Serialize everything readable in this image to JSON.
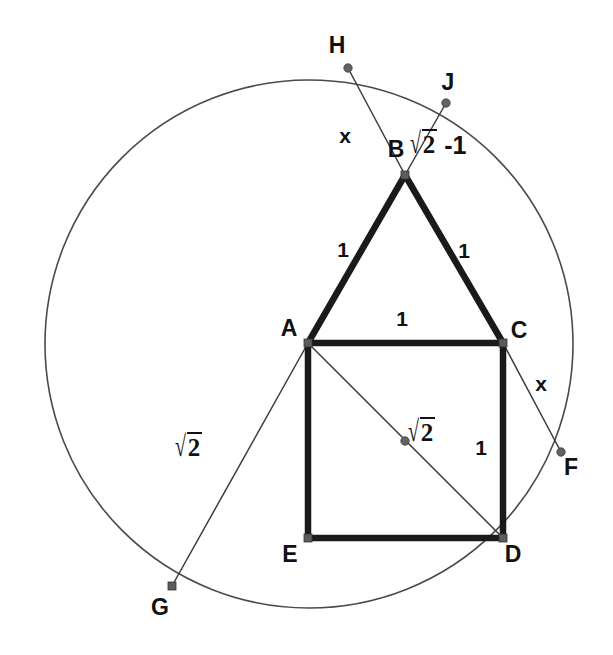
{
  "figure": {
    "type": "geometry-diagram",
    "canvas": {
      "width": 613,
      "height": 655,
      "background": "#ffffff"
    },
    "colors": {
      "circle_stroke": "#4a4a4a",
      "thick_edge": "#1a1a1a",
      "thin_edge": "#3c3c3c",
      "vertex_marker": "#5c5c5c",
      "text": "#111111"
    },
    "circle": {
      "cx": 309,
      "cy": 344,
      "r": 264,
      "label": "circumscribed-circle"
    },
    "points": [
      {
        "id": "A",
        "label": "A",
        "x": 308,
        "y": 343,
        "label_x": 289,
        "label_y": 336,
        "marker": "square"
      },
      {
        "id": "B",
        "label": "B",
        "x": 405,
        "y": 175,
        "label_x": 396,
        "label_y": 157,
        "marker": "square"
      },
      {
        "id": "C",
        "label": "C",
        "x": 503,
        "y": 343,
        "label_x": 519,
        "label_y": 338,
        "marker": "square"
      },
      {
        "id": "D",
        "label": "D",
        "x": 503,
        "y": 538,
        "label_x": 513,
        "label_y": 562,
        "marker": "square"
      },
      {
        "id": "E",
        "label": "E",
        "x": 308,
        "y": 538,
        "label_x": 290,
        "label_y": 562,
        "marker": "square"
      },
      {
        "id": "F",
        "label": "F",
        "x": 561,
        "y": 452,
        "label_x": 571,
        "label_y": 475,
        "marker": "dot"
      },
      {
        "id": "G",
        "label": "G",
        "x": 172,
        "y": 586,
        "label_x": 160,
        "label_y": 615,
        "marker": "square"
      },
      {
        "id": "H",
        "label": "H",
        "x": 348,
        "y": 68,
        "label_x": 337,
        "label_y": 53,
        "marker": "dot"
      },
      {
        "id": "J",
        "label": "J",
        "x": 446,
        "y": 103,
        "label_x": 448,
        "label_y": 90,
        "marker": "dot"
      },
      {
        "id": "M",
        "label": "",
        "x": 405,
        "y": 441,
        "label_x": 0,
        "label_y": 0,
        "marker": "dot"
      }
    ],
    "thick_edges": [
      {
        "name": "edge-A-B",
        "from": "A",
        "to": "B"
      },
      {
        "name": "edge-B-C",
        "from": "B",
        "to": "C"
      },
      {
        "name": "edge-A-C",
        "from": "A",
        "to": "C"
      },
      {
        "name": "edge-C-D",
        "from": "C",
        "to": "D"
      },
      {
        "name": "edge-D-E",
        "from": "D",
        "to": "E"
      },
      {
        "name": "edge-E-A",
        "from": "E",
        "to": "A"
      }
    ],
    "thin_edges": [
      {
        "name": "chord-H-B",
        "from": "H",
        "to": "B"
      },
      {
        "name": "chord-B-J",
        "from": "B",
        "to": "J"
      },
      {
        "name": "chord-C-F",
        "from": "C",
        "to": "F"
      },
      {
        "name": "chord-A-D",
        "from": "A",
        "to": "D"
      },
      {
        "name": "chord-A-G",
        "from": "A",
        "to": "G"
      }
    ],
    "length_labels": [
      {
        "name": "label-x-HB",
        "text": "x",
        "x": 345,
        "y": 143,
        "kind": "plain"
      },
      {
        "name": "label-sqrt2-minus-1-BJ",
        "text": "√2 -1",
        "x": 432,
        "y": 152,
        "kind": "radical",
        "radicand": "2",
        "suffix": "-1"
      },
      {
        "name": "label-1-AB",
        "text": "1",
        "x": 343,
        "y": 257,
        "kind": "plain"
      },
      {
        "name": "label-1-BC",
        "text": "1",
        "x": 464,
        "y": 258,
        "kind": "plain"
      },
      {
        "name": "label-1-AC",
        "text": "1",
        "x": 402,
        "y": 326,
        "kind": "plain"
      },
      {
        "name": "label-x-CF",
        "text": "x",
        "x": 541,
        "y": 391,
        "kind": "plain"
      },
      {
        "name": "label-1-CD",
        "text": "1",
        "x": 481,
        "y": 455,
        "kind": "plain"
      },
      {
        "name": "label-sqrt2-AD",
        "text": "√2",
        "x": 430,
        "y": 440,
        "kind": "radical",
        "radicand": "2",
        "suffix": ""
      },
      {
        "name": "label-sqrt2-AG",
        "text": "√2",
        "x": 197,
        "y": 455,
        "kind": "radical",
        "radicand": "2",
        "suffix": ""
      }
    ]
  }
}
